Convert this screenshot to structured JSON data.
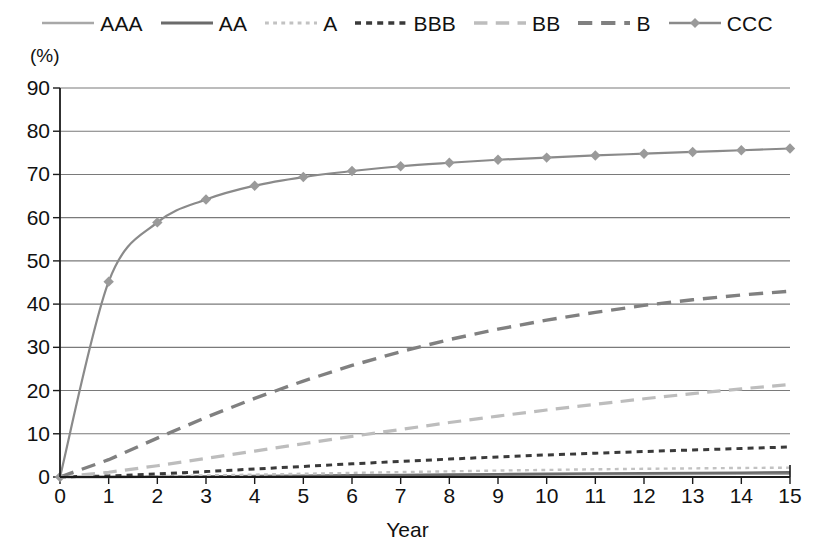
{
  "chart_data": {
    "type": "line",
    "title": "",
    "subtitle": "",
    "xlabel": "Year",
    "ylabel": "(%)",
    "ylim": [
      0,
      90
    ],
    "xlim": [
      0,
      15
    ],
    "ytick_step": 10,
    "xtick_step": 1,
    "grid": "horizontal",
    "legend_position": "top",
    "yticks": [
      "0",
      "10",
      "20",
      "30",
      "40",
      "50",
      "60",
      "70",
      "80",
      "90"
    ],
    "xticks": [
      "0",
      "1",
      "2",
      "3",
      "4",
      "5",
      "6",
      "7",
      "8",
      "9",
      "10",
      "11",
      "12",
      "13",
      "14",
      "15"
    ],
    "x": [
      0,
      1,
      2,
      3,
      4,
      5,
      6,
      7,
      8,
      9,
      10,
      11,
      12,
      13,
      14,
      15
    ],
    "series": [
      {
        "name": "AAA",
        "color": "#a8a8a8",
        "style": "solid",
        "width": 2.2,
        "marker": "none",
        "values": [
          0,
          0.0,
          0.03,
          0.07,
          0.13,
          0.2,
          0.28,
          0.35,
          0.42,
          0.48,
          0.53,
          0.58,
          0.62,
          0.66,
          0.69,
          0.72
        ]
      },
      {
        "name": "AA",
        "color": "#6b6b6b",
        "style": "solid",
        "width": 2.6,
        "marker": "none",
        "values": [
          0,
          0.02,
          0.06,
          0.12,
          0.2,
          0.29,
          0.38,
          0.47,
          0.56,
          0.64,
          0.72,
          0.8,
          0.87,
          0.94,
          1.0,
          1.06
        ]
      },
      {
        "name": "A",
        "color": "#c2c2c2",
        "style": "dashed-short",
        "width": 2.4,
        "marker": "none",
        "values": [
          0,
          0.07,
          0.2,
          0.36,
          0.55,
          0.75,
          0.95,
          1.14,
          1.32,
          1.49,
          1.64,
          1.78,
          1.9,
          2.0,
          2.09,
          2.16
        ]
      },
      {
        "name": "BBB",
        "color": "#3a3a3a",
        "style": "dashed-med",
        "width": 3.0,
        "marker": "none",
        "values": [
          0,
          0.25,
          0.7,
          1.25,
          1.85,
          2.45,
          3.05,
          3.6,
          4.15,
          4.65,
          5.1,
          5.5,
          5.9,
          6.25,
          6.6,
          6.95
        ]
      },
      {
        "name": "BB",
        "color": "#bdbdbd",
        "style": "dashed-long",
        "width": 3.2,
        "marker": "none",
        "values": [
          0,
          1.1,
          2.6,
          4.3,
          6.0,
          7.7,
          9.4,
          11.0,
          12.6,
          14.1,
          15.5,
          16.8,
          18.1,
          19.3,
          20.4,
          21.4
        ]
      },
      {
        "name": "B",
        "color": "#808080",
        "style": "dashed-long",
        "width": 3.4,
        "marker": "none",
        "values": [
          0,
          4.0,
          9.0,
          13.8,
          18.2,
          22.2,
          25.8,
          29.0,
          31.8,
          34.2,
          36.3,
          38.1,
          39.7,
          41.0,
          42.1,
          43.0
        ]
      },
      {
        "name": "CCC",
        "color": "#8a8a8a",
        "style": "solid",
        "width": 2.2,
        "marker": "diamond",
        "marker_color": "#9a9a9a",
        "values": [
          0,
          45.2,
          58.9,
          64.2,
          67.4,
          69.4,
          70.8,
          71.9,
          72.7,
          73.4,
          73.9,
          74.4,
          74.8,
          75.2,
          75.6,
          76.0
        ]
      }
    ]
  },
  "legend": {
    "items": [
      {
        "label": "AAA",
        "icon": "line-solid-light-icon"
      },
      {
        "label": "AA",
        "icon": "line-solid-dark-icon"
      },
      {
        "label": "A",
        "icon": "line-dashed-light-icon"
      },
      {
        "label": "BBB",
        "icon": "line-dashed-dark-icon"
      },
      {
        "label": "BB",
        "icon": "line-longdash-light-icon"
      },
      {
        "label": "B",
        "icon": "line-longdash-gray-icon"
      },
      {
        "label": "CCC",
        "icon": "line-diamond-marker-icon"
      }
    ]
  },
  "axes": {
    "unit_label": "(%)",
    "x_title": "Year"
  },
  "colors": {
    "axis": "#1a1a1a",
    "grid": "#7a7a7a",
    "background": "#ffffff"
  }
}
